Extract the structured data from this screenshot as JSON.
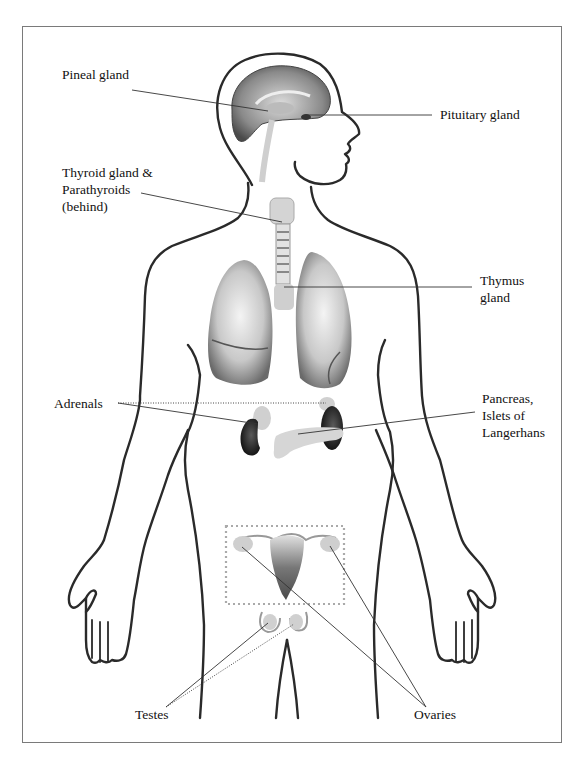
{
  "diagram": {
    "labels": {
      "pineal": {
        "text": "Pineal gland"
      },
      "pituitary": {
        "text": "Pituitary gland"
      },
      "thyroid": {
        "lines": [
          "Thyroid gland &",
          "Parathyroids",
          "(behind)"
        ]
      },
      "thymus": {
        "lines": [
          "Thymus",
          "gland"
        ]
      },
      "adrenals": {
        "text": "Adrenals"
      },
      "pancreas": {
        "lines": [
          "Pancreas,",
          "Islets of",
          "Langerhans"
        ]
      },
      "testes": {
        "text": "Testes"
      },
      "ovaries": {
        "text": "Ovaries"
      }
    },
    "colors": {
      "outline": "#2a2a2a",
      "leader_line": "#333333",
      "frame": "#7a7a7a",
      "organ_light": "#d8d8d8",
      "organ_mid": "#a8a8a8",
      "organ_dark": "#2b2b2b",
      "dotted_box": "#aaaaaa"
    }
  }
}
